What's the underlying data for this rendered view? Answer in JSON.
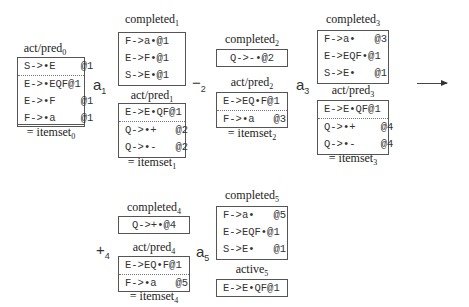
{
  "itemsets": {
    "s0": {
      "act_label": "act/pred",
      "act_sub": "0",
      "act_rows": [
        "S->•E    @1",
        "E->•EQF@1",
        "E->•F    @1",
        "F->•a    @1"
      ],
      "eq_label": "= itemset",
      "eq_sub": "0"
    },
    "s1": {
      "completed_label": "completed",
      "completed_sub": "1",
      "completed_rows": [
        "F->a•@1",
        "E->F•@1",
        "S->E•@1"
      ],
      "act_label": "act/pred",
      "act_sub": "1",
      "act_rows": [
        "E->E•QF@1",
        "Q->•+   @2",
        "Q->•-   @2"
      ],
      "eq_label": "= itemset",
      "eq_sub": "1"
    },
    "s2": {
      "completed_label": "completed",
      "completed_sub": "2",
      "completed_rows": [
        "Q->-•@2"
      ],
      "act_label": "act/pred",
      "act_sub": "2",
      "act_rows": [
        "E->EQ•F@1",
        "F->•a   @3"
      ],
      "eq_label": "= itemset",
      "eq_sub": "2"
    },
    "s3": {
      "completed_label": "completed",
      "completed_sub": "3",
      "completed_rows": [
        "F->a•   @3",
        "E->EQF•@1",
        "S->E•   @1"
      ],
      "act_label": "act/pred",
      "act_sub": "3",
      "act_rows": [
        "E->E•QF@1",
        "Q->•+    @4",
        "Q->•-    @4"
      ],
      "eq_label": "= itemset",
      "eq_sub": "3"
    },
    "s4": {
      "completed_label": "completed",
      "completed_sub": "4",
      "completed_rows": [
        "Q->+•@4"
      ],
      "act_label": "act/pred",
      "act_sub": "4",
      "act_rows": [
        "E->EQ•F@1",
        "F->•a   @5"
      ],
      "eq_label": "= itemset",
      "eq_sub": "4"
    },
    "s5": {
      "completed_label": "completed",
      "completed_sub": "5",
      "completed_rows": [
        "F->a•   @5",
        "E->EQF•@1",
        "S->E•   @1"
      ],
      "active_label": "active",
      "active_sub": "5",
      "active_rows": [
        "E->E•QF@1"
      ]
    }
  },
  "transitions": [
    {
      "sym": "a",
      "sub": "1"
    },
    {
      "sym": "−",
      "sub": "2"
    },
    {
      "sym": "a",
      "sub": "3"
    },
    {
      "sym": "+",
      "sub": "4"
    },
    {
      "sym": "a",
      "sub": "5"
    }
  ],
  "continuation_arrow": "right-arrow-icon"
}
